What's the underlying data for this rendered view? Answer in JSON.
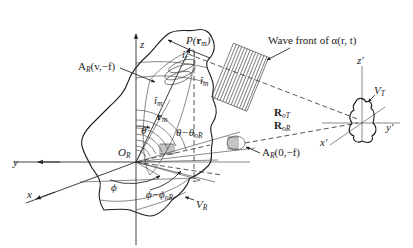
{
  "diagram": {
    "type": "geometry-schematic",
    "receiver_frame": {
      "origin_label": "O",
      "origin_sub": "R",
      "axes": {
        "x": "x",
        "y": "y",
        "z": "z"
      },
      "volume_label": "V",
      "volume_sub": "R"
    },
    "target_frame": {
      "axes": {
        "x": "x′",
        "y": "y′",
        "z": "z′"
      },
      "volume_label": "V",
      "volume_sub": "T"
    },
    "labels": {
      "point_P": "P(",
      "point_P_vec": "r",
      "point_P_sub": "m",
      "point_P_close": ")",
      "r_m": "r",
      "r_m_sub": "m",
      "i_m_top": "î",
      "i_m_top_sub": "m",
      "i_m_left": "î",
      "i_m_left_sub": "m",
      "i_r": "î",
      "i_r_sub": "r",
      "theta": "θ",
      "theta_diff": "θ−θ",
      "theta_diff_sub": "oR",
      "phi": "ϕ",
      "phi_diff": "ϕ−ϕ",
      "phi_diff_sub": "oR",
      "A_v": "A",
      "A_v_sub": "R",
      "A_v_args": "(v,−f)",
      "A_0": "A",
      "A_0_sub": "R",
      "A_0_args": "(0,−f)",
      "R_oT": "R",
      "R_oT_sub": "oT",
      "R_oR": "R",
      "R_oR_sub": "oR",
      "wave_front": "Wave front of α(r, t)"
    }
  }
}
